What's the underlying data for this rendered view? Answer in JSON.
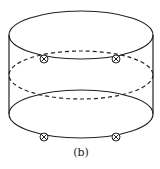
{
  "figure": {
    "label": "(b)",
    "stroke_color": "#222222",
    "markers": [
      {
        "x": 44,
        "y": 59
      },
      {
        "x": 116,
        "y": 59
      },
      {
        "x": 44,
        "y": 137
      },
      {
        "x": 116,
        "y": 137
      }
    ]
  }
}
